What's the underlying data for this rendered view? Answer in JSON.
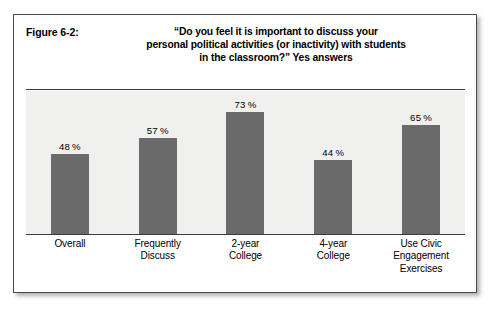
{
  "figure": {
    "number_label": "Figure 6-2:",
    "title_lines": [
      "“Do you feel it is important to discuss your",
      "personal political activities (or inactivity) with students",
      "in the classroom?”  Yes answers"
    ]
  },
  "colors": {
    "bar_fill": "#6a6a6a",
    "plot_background": "#f0f0ee",
    "axis": "#3c3c3c",
    "frame_border": "#4a4a4a",
    "text": "#000000"
  },
  "chart_data": {
    "type": "bar",
    "title": "“Do you feel it is important to discuss your personal political activities (or inactivity) with students in the classroom?”  Yes answers",
    "xlabel": "",
    "ylabel": "",
    "ylim": [
      0,
      100
    ],
    "grid": false,
    "legend": "none",
    "categories": [
      "Overall",
      "Frequently Discuss",
      "2-year College",
      "4-year College",
      "Use Civic Engagement Exercises"
    ],
    "category_lines": [
      [
        "Overall"
      ],
      [
        "Frequently",
        "Discuss"
      ],
      [
        "2-year",
        "College"
      ],
      [
        "4-year",
        "College"
      ],
      [
        "Use Civic",
        "Engagement",
        "Exercises"
      ]
    ],
    "values": [
      48,
      57,
      73,
      44,
      65
    ],
    "value_labels": [
      "48 %",
      "57 %",
      "73 %",
      "44 %",
      "65 %"
    ]
  }
}
